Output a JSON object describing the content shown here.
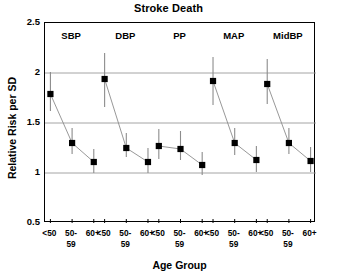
{
  "chart_data": {
    "type": "scatter",
    "title": "Stroke Death",
    "xlabel": "Age Group",
    "ylabel": "Relative Risk per SD",
    "ylim": [
      0.5,
      2.5
    ],
    "yticks": [
      "0.5",
      "1",
      "1.5",
      "2",
      "2.5"
    ],
    "ytick_values": [
      0.5,
      1,
      1.5,
      2,
      2.5
    ],
    "gridlines": [
      1,
      1.5,
      2
    ],
    "grid": true,
    "legend": "none",
    "marker": "filled-square",
    "errorbars": true,
    "categories": [
      "<50",
      "50-59",
      "60+"
    ],
    "category_label_lines": [
      [
        "<50"
      ],
      [
        "50-",
        "59"
      ],
      [
        "60+"
      ]
    ],
    "groups": [
      "SBP",
      "DBP",
      "PP",
      "MAP",
      "MidBP"
    ],
    "series": [
      {
        "name": "SBP",
        "values": [
          1.79,
          1.3,
          1.11
        ],
        "ci_low": [
          1.62,
          1.19,
          1.0
        ],
        "ci_high": [
          2.01,
          1.45,
          1.24
        ]
      },
      {
        "name": "DBP",
        "values": [
          1.94,
          1.25,
          1.11
        ],
        "ci_low": [
          1.66,
          1.16,
          1.0
        ],
        "ci_high": [
          2.2,
          1.4,
          1.25
        ]
      },
      {
        "name": "PP",
        "values": [
          1.27,
          1.24,
          1.08
        ],
        "ci_low": [
          1.14,
          1.13,
          0.98
        ],
        "ci_high": [
          1.44,
          1.42,
          1.21
        ]
      },
      {
        "name": "MAP",
        "values": [
          1.92,
          1.3,
          1.13
        ],
        "ci_low": [
          1.68,
          1.18,
          1.01
        ],
        "ci_high": [
          2.16,
          1.45,
          1.27
        ]
      },
      {
        "name": "MidBP",
        "values": [
          1.89,
          1.3,
          1.12
        ],
        "ci_low": [
          1.69,
          1.19,
          1.01
        ],
        "ci_high": [
          2.14,
          1.45,
          1.26
        ]
      }
    ],
    "colors": {
      "marker": "#000000",
      "errorbar": "#8c8c8c",
      "connector": "#8c8c8c",
      "gridline": "#9a9a9a",
      "axis": "#000000",
      "background": "#ffffff",
      "text": "#000000"
    }
  }
}
